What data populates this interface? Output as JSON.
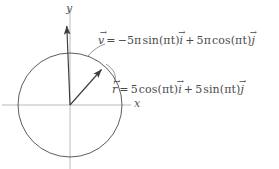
{
  "figure": {
    "background_color": "#ffffff",
    "axis_color": "#b9b9b9",
    "curve_color": "#4a4a4a",
    "vector_color": "#3d3d3d",
    "text_color": "#4a4a4a"
  },
  "axes": {
    "x_label": "x",
    "y_label": "y",
    "origin": {
      "x": 70,
      "y": 105
    }
  },
  "circle": {
    "center_x": 70,
    "center_y": 105,
    "radius": 52,
    "radius_value": 5
  },
  "vectors": [
    {
      "name": "position-vector",
      "symbol": "r",
      "from_x": 70,
      "from_y": 105,
      "to_x": 103,
      "to_y": 68
    },
    {
      "name": "velocity-vector",
      "symbol": "v",
      "from_x": 70,
      "from_y": 105,
      "to_x": 66,
      "to_y": 23
    }
  ],
  "equations": {
    "velocity": {
      "lhs": "v",
      "equals": "=",
      "term1_sign": "−",
      "term1_coeff": "5π",
      "term1_fn": "sin(πt)",
      "term1_unit": "i",
      "term2_sign": "+",
      "term2_coeff": "5π",
      "term2_fn": "cos(πt)",
      "term2_unit": "j",
      "plain": "v = −5π sin(πt) i + 5π cos(πt) j"
    },
    "position": {
      "lhs": "r",
      "equals": "=",
      "term1_coeff": "5",
      "term1_fn": "cos(πt)",
      "term1_unit": "i",
      "term2_sign": "+",
      "term2_coeff": "5",
      "term2_fn": "sin(πt)",
      "term2_unit": "j",
      "plain": "r = 5 cos(πt) i + 5 sin(πt) j"
    }
  }
}
